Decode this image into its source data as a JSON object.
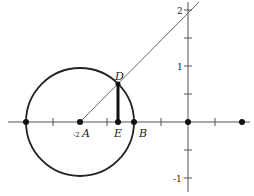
{
  "figure": {
    "type": "unit circle diagram",
    "points": {
      "A": {
        "label": "A",
        "x_label": "-2"
      },
      "B": {
        "label": "B"
      },
      "D": {
        "label": "D"
      },
      "E": {
        "label": "E"
      }
    },
    "y_ticks": [
      {
        "label": "2"
      },
      {
        "label": "1"
      },
      {
        "label": "-1"
      }
    ],
    "colors": {
      "circle": "#222222",
      "axes": "#555555",
      "line": "#555555",
      "segment": "#111111"
    }
  }
}
